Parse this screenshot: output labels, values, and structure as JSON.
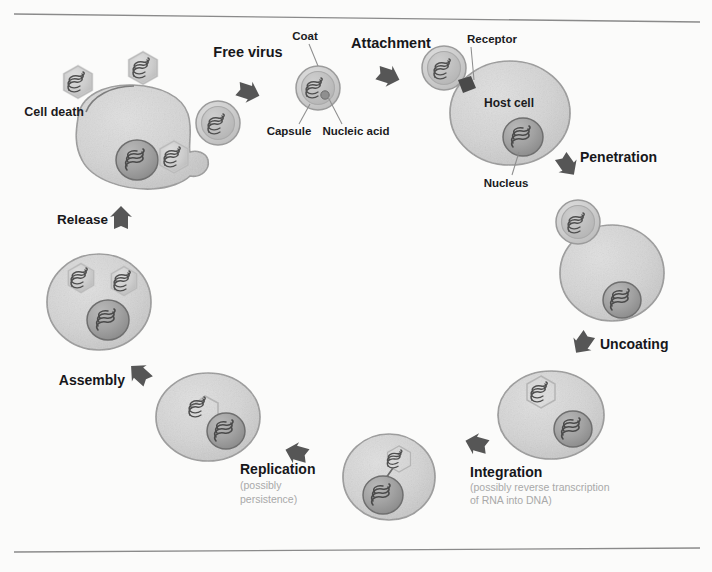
{
  "figure": {
    "background_color": "#fbfbfa",
    "rules": {
      "top": true,
      "bottom": true,
      "color": "#8a8a8a"
    },
    "palette": {
      "cell_fill": "#d4d4d4",
      "cell_stroke": "#9a9a9a",
      "nucleus_fill": "#a0a0a0",
      "nucleus_stroke": "#6f6f6f",
      "capsid_fill": "#cfcfcf",
      "capsid_stroke": "#9b9b9b",
      "coat_fill": "#bdbdbd",
      "nucleic_acid": "#5b5b5b",
      "arrow_fill": "#565656",
      "receptor_fill": "#4a4a4a",
      "label_text": "#17171a",
      "sub_label_text": "#a9a9a9",
      "callout_line": "#8e8e8e"
    }
  },
  "stages": [
    {
      "id": "free-virus",
      "label": "Free virus",
      "sublabel": "",
      "x": 248,
      "y": 52
    },
    {
      "id": "attachment",
      "label": "Attachment",
      "sublabel": "",
      "x": 391,
      "y": 44
    },
    {
      "id": "penetration",
      "label": "Penetration",
      "sublabel": "",
      "x": 615,
      "y": 158
    },
    {
      "id": "uncoating",
      "label": "Uncoating",
      "sublabel": "",
      "x": 637,
      "y": 345
    },
    {
      "id": "integration",
      "label": "Integration",
      "sublabel": "(possibly reverse transcription\nof RNA into DNA)",
      "x": 514,
      "y": 471
    },
    {
      "id": "replication",
      "label": "Replication",
      "sublabel": "(possibly\npersistence)",
      "x": 285,
      "y": 469
    },
    {
      "id": "assembly",
      "label": "Assembly",
      "sublabel": "",
      "x": 93,
      "y": 382
    },
    {
      "id": "release",
      "label": "Release",
      "sublabel": "",
      "x": 100,
      "y": 222
    },
    {
      "id": "cell-death",
      "label": "Cell death",
      "sublabel": "",
      "x": 47,
      "y": 112
    }
  ],
  "stage_sublabels": {
    "integration": [
      "(possibly reverse transcription",
      "of RNA into DNA)"
    ],
    "replication": [
      "(possibly",
      "persistence)"
    ]
  },
  "part_callouts": [
    {
      "id": "coat",
      "label": "Coat",
      "x": 299,
      "y": 36
    },
    {
      "id": "capsule",
      "label": "Capsule",
      "x": 281,
      "y": 130
    },
    {
      "id": "nucleic-acid",
      "label": "Nucleic acid",
      "x": 351,
      "y": 130
    },
    {
      "id": "receptor",
      "label": "Receptor",
      "x": 465,
      "y": 40
    },
    {
      "id": "host-cell",
      "label": "Host cell",
      "x": 509,
      "y": 103
    },
    {
      "id": "nucleus",
      "label": "Nucleus",
      "x": 504,
      "y": 182
    }
  ],
  "cycle_order": [
    "free-virus",
    "attachment",
    "penetration",
    "uncoating",
    "integration",
    "replication",
    "assembly",
    "release",
    "cell-death"
  ]
}
